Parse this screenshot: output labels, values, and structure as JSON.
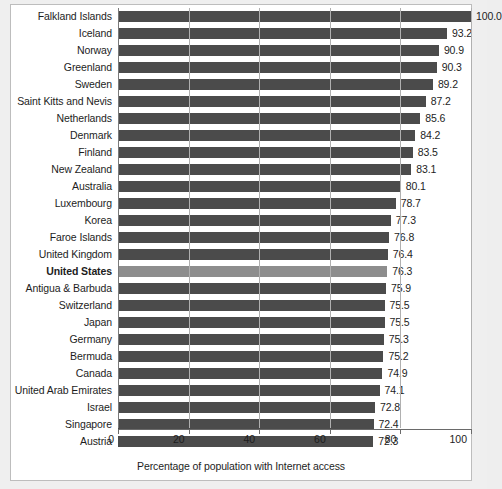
{
  "chart_data": {
    "type": "bar",
    "orientation": "horizontal",
    "title": "",
    "subtitle": "",
    "xlabel": "Percentage of population with Internet access",
    "ylabel": "",
    "xlim": [
      0,
      100
    ],
    "xticks": [
      0,
      20,
      40,
      60,
      80,
      100
    ],
    "xtick_labels": [
      "0",
      "20",
      "40",
      "60",
      "80",
      "100"
    ],
    "grid": true,
    "grid_axis": "x",
    "legend": false,
    "value_labels": true,
    "value_label_format": "one-decimal",
    "highlight_category": "United States",
    "bar_color": "#4b4b4b",
    "highlight_bar_color": "#8d8d8d",
    "background_color": "#ffffff",
    "categories": [
      "Falkland Islands",
      "Iceland",
      "Norway",
      "Greenland",
      "Sweden",
      "Saint Kitts and Nevis",
      "Netherlands",
      "Denmark",
      "Finland",
      "New Zealand",
      "Australia",
      "Luxembourg",
      "Korea",
      "Faroe Islands",
      "United Kingdom",
      "United States",
      "Antigua & Barbuda",
      "Switzerland",
      "Japan",
      "Germany",
      "Bermuda",
      "Canada",
      "United Arab Emirates",
      "Israel",
      "Singapore",
      "Austria"
    ],
    "values": [
      100.0,
      93.2,
      90.9,
      90.3,
      89.2,
      87.2,
      85.6,
      84.2,
      83.5,
      83.1,
      80.1,
      78.7,
      77.3,
      76.8,
      76.4,
      76.3,
      75.9,
      75.5,
      75.5,
      75.3,
      75.2,
      74.9,
      74.1,
      72.8,
      72.4,
      72.3
    ],
    "value_labels_text": [
      "100.0",
      "93.2",
      "90.9",
      "90.3",
      "89.2",
      "87.2",
      "85.6",
      "84.2",
      "83.5",
      "83.1",
      "80.1",
      "78.7",
      "77.3",
      "76.8",
      "76.4",
      "76.3",
      "75.9",
      "75.5",
      "75.5",
      "75.3",
      "75.2",
      "74.9",
      "74.1",
      "72.8",
      "72.4",
      "72.3"
    ]
  }
}
